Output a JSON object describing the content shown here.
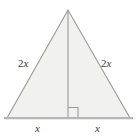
{
  "figure": {
    "background_color": "#ffffff",
    "fill_color": "#f1f1ef",
    "stroke_color": "#9a9a9a",
    "base_stroke_color": "#b5b5b5",
    "label_color": "#3b3b3b",
    "labels": {
      "left_side": {
        "coefficient": "2",
        "variable": "x"
      },
      "right_side": {
        "coefficient": "2",
        "variable": "x"
      },
      "base_left": {
        "coefficient": "",
        "variable": "x"
      },
      "base_right": {
        "coefficient": "",
        "variable": "x"
      }
    },
    "shapes": {
      "triangle": {
        "apex": [
          68,
          10
        ],
        "bottom_left": [
          7,
          118
        ],
        "bottom_right": [
          130,
          118
        ]
      },
      "altitude": {
        "from": [
          68,
          10
        ],
        "to": [
          68,
          118
        ]
      },
      "right_angle_marker": {
        "x": 68,
        "y": 107,
        "size": 10
      },
      "base_line": {
        "from": [
          4,
          118
        ],
        "to": [
          133,
          118
        ]
      }
    }
  }
}
